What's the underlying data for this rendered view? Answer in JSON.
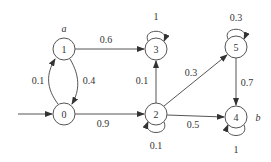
{
  "diagram": {
    "type": "markov-chain-state-diagram",
    "nodes": [
      {
        "id": "0",
        "label": "0",
        "x": 64,
        "y": 114
      },
      {
        "id": "1",
        "label": "1",
        "x": 64,
        "y": 49,
        "tag": "a"
      },
      {
        "id": "2",
        "label": "2",
        "x": 156,
        "y": 114
      },
      {
        "id": "3",
        "label": "3",
        "x": 156,
        "y": 49
      },
      {
        "id": "4",
        "label": "4",
        "x": 236,
        "y": 117,
        "tag": "b"
      },
      {
        "id": "5",
        "label": "5",
        "x": 236,
        "y": 47
      }
    ],
    "edges": [
      {
        "from": "start",
        "to": "0",
        "label": ""
      },
      {
        "from": "0",
        "to": "1",
        "label": "0.1"
      },
      {
        "from": "1",
        "to": "0",
        "label": "0.4"
      },
      {
        "from": "1",
        "to": "3",
        "label": "0.6"
      },
      {
        "from": "0",
        "to": "2",
        "label": "0.9"
      },
      {
        "from": "2",
        "to": "3",
        "label": "0.1"
      },
      {
        "from": "2",
        "to": "5",
        "label": "0.3"
      },
      {
        "from": "2",
        "to": "4",
        "label": "0.5"
      },
      {
        "from": "2",
        "to": "2",
        "label": "0.1"
      },
      {
        "from": "3",
        "to": "3",
        "label": "1"
      },
      {
        "from": "5",
        "to": "5",
        "label": "0.3"
      },
      {
        "from": "5",
        "to": "4",
        "label": "0.7"
      },
      {
        "from": "4",
        "to": "4",
        "label": "1"
      }
    ],
    "tags": {
      "a": "a",
      "b": "b"
    },
    "labels": {
      "n0": "0",
      "n1": "1",
      "n2": "2",
      "n3": "3",
      "n4": "4",
      "n5": "5",
      "e01": "0.1",
      "e10": "0.4",
      "e13": "0.6",
      "e02": "0.9",
      "e23": "0.1",
      "e25": "0.3",
      "e24": "0.5",
      "e22": "0.1",
      "e33": "1",
      "e55": "0.3",
      "e54": "0.7",
      "e44": "1"
    }
  }
}
